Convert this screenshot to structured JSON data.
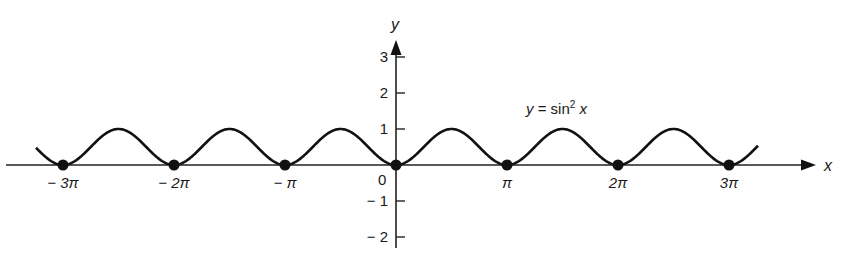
{
  "chart_data": {
    "type": "line",
    "title": "",
    "equation_label": "y = sin² x",
    "xlabel": "x",
    "ylabel": "y",
    "function": "sin^2(x)",
    "x_range": [
      -3.3,
      3.3
    ],
    "x_range_unit": "pi",
    "xlim_pixels": [
      36,
      758
    ],
    "ylim": [
      -2.2,
      3.5
    ],
    "x_ticks": [
      {
        "value": -3,
        "label": "− 3π"
      },
      {
        "value": -2,
        "label": "− 2π"
      },
      {
        "value": -1,
        "label": "− π"
      },
      {
        "value": 1,
        "label": "π"
      },
      {
        "value": 2,
        "label": "2π"
      },
      {
        "value": 3,
        "label": "3π"
      }
    ],
    "origin_label": "0",
    "y_ticks": [
      {
        "value": 3,
        "label": "3"
      },
      {
        "value": 2,
        "label": "2"
      },
      {
        "value": 1,
        "label": "1"
      },
      {
        "value": -1,
        "label": "− 1"
      },
      {
        "value": -2,
        "label": "− 2"
      }
    ],
    "zeros_marked": [
      -3,
      -2,
      -1,
      0,
      1,
      2,
      3
    ],
    "zeros_unit": "pi",
    "peak_value": 1,
    "trough_value": 0,
    "period": "π",
    "grid": false,
    "legend": "none",
    "colors": {
      "curve": "#111111",
      "axis": "#222222",
      "text": "#1a1a1a"
    }
  }
}
